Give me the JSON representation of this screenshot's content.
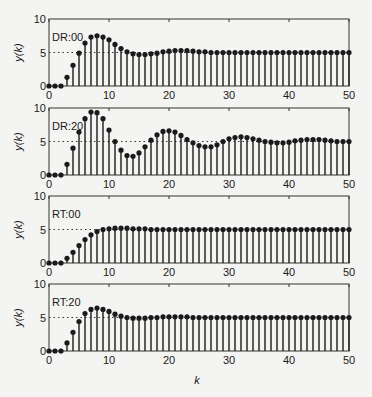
{
  "figure": {
    "xlabel": "k",
    "ylabel": "y(k)",
    "colors": {
      "stem": "#1a1a1a",
      "frame": "#333333",
      "reference": "#333333",
      "background": "#f4f4f2"
    }
  },
  "chart_data": [
    {
      "type": "stem",
      "label": "DR:00",
      "xlabel": "",
      "ylabel": "y(k)",
      "xlim": [
        0,
        50
      ],
      "ylim": [
        0,
        10
      ],
      "xticks": [
        0,
        10,
        20,
        30,
        40,
        50
      ],
      "yticks": [
        0,
        5,
        10
      ],
      "reference_line": 5,
      "x": [
        0,
        1,
        2,
        3,
        4,
        5,
        6,
        7,
        8,
        9,
        10,
        11,
        12,
        13,
        14,
        15,
        16,
        17,
        18,
        19,
        20,
        21,
        22,
        23,
        24,
        25,
        26,
        27,
        28,
        29,
        30,
        31,
        32,
        33,
        34,
        35,
        36,
        37,
        38,
        39,
        40,
        41,
        42,
        43,
        44,
        45,
        46,
        47,
        48,
        49,
        50
      ],
      "values": [
        0,
        0,
        0,
        1.3,
        3.1,
        4.9,
        6.4,
        7.3,
        7.5,
        7.3,
        6.9,
        6.2,
        5.6,
        5.1,
        4.8,
        4.7,
        4.7,
        4.8,
        4.9,
        5.1,
        5.2,
        5.3,
        5.3,
        5.3,
        5.2,
        5.1,
        5.1,
        5.0,
        5.0,
        5.0,
        5.0,
        5.0,
        5.0,
        5.0,
        5.0,
        5.0,
        5.0,
        5.0,
        5.0,
        5.0,
        5.0,
        5.0,
        5.0,
        5.0,
        5.0,
        5.0,
        5.0,
        5.0,
        5.0,
        5.0,
        5.0
      ]
    },
    {
      "type": "stem",
      "label": "DR:20",
      "xlabel": "",
      "ylabel": "y(k)",
      "xlim": [
        0,
        50
      ],
      "ylim": [
        0,
        10
      ],
      "xticks": [
        0,
        10,
        20,
        30,
        40,
        50
      ],
      "yticks": [
        0,
        5,
        10
      ],
      "reference_line": 5,
      "x": [
        0,
        1,
        2,
        3,
        4,
        5,
        6,
        7,
        8,
        9,
        10,
        11,
        12,
        13,
        14,
        15,
        16,
        17,
        18,
        19,
        20,
        21,
        22,
        23,
        24,
        25,
        26,
        27,
        28,
        29,
        30,
        31,
        32,
        33,
        34,
        35,
        36,
        37,
        38,
        39,
        40,
        41,
        42,
        43,
        44,
        45,
        46,
        47,
        48,
        49,
        50
      ],
      "values": [
        0,
        0,
        0,
        1.6,
        4.0,
        6.4,
        8.4,
        9.4,
        9.3,
        8.4,
        6.7,
        5.0,
        3.7,
        2.9,
        2.8,
        3.3,
        4.2,
        5.2,
        6.0,
        6.5,
        6.6,
        6.4,
        5.9,
        5.3,
        4.8,
        4.4,
        4.2,
        4.2,
        4.5,
        5.0,
        5.4,
        5.6,
        5.7,
        5.6,
        5.4,
        5.2,
        5.0,
        4.9,
        4.8,
        4.8,
        4.9,
        5.1,
        5.2,
        5.3,
        5.3,
        5.3,
        5.2,
        5.1,
        5.0,
        5.0,
        5.0
      ]
    },
    {
      "type": "stem",
      "label": "RT:00",
      "xlabel": "",
      "ylabel": "y(k)",
      "xlim": [
        0,
        50
      ],
      "ylim": [
        0,
        10
      ],
      "xticks": [
        0,
        10,
        20,
        30,
        40,
        50
      ],
      "yticks": [
        0,
        5,
        10
      ],
      "reference_line": 5,
      "x": [
        0,
        1,
        2,
        3,
        4,
        5,
        6,
        7,
        8,
        9,
        10,
        11,
        12,
        13,
        14,
        15,
        16,
        17,
        18,
        19,
        20,
        21,
        22,
        23,
        24,
        25,
        26,
        27,
        28,
        29,
        30,
        31,
        32,
        33,
        34,
        35,
        36,
        37,
        38,
        39,
        40,
        41,
        42,
        43,
        44,
        45,
        46,
        47,
        48,
        49,
        50
      ],
      "values": [
        0,
        0,
        0,
        0.7,
        1.6,
        2.6,
        3.5,
        4.2,
        4.7,
        5.0,
        5.1,
        5.2,
        5.2,
        5.2,
        5.1,
        5.1,
        5.1,
        5.0,
        5.0,
        5.0,
        5.0,
        5.0,
        5.0,
        5.0,
        5.0,
        5.0,
        5.0,
        5.0,
        5.0,
        5.0,
        5.0,
        5.0,
        5.0,
        5.0,
        5.0,
        5.0,
        5.0,
        5.0,
        5.0,
        5.0,
        5.0,
        5.0,
        5.0,
        5.0,
        5.0,
        5.0,
        5.0,
        5.0,
        5.0,
        5.0,
        5.0
      ]
    },
    {
      "type": "stem",
      "label": "RT:20",
      "xlabel": "k",
      "ylabel": "y(k)",
      "xlim": [
        0,
        50
      ],
      "ylim": [
        0,
        10
      ],
      "xticks": [
        0,
        10,
        20,
        30,
        40,
        50
      ],
      "yticks": [
        0,
        5,
        10
      ],
      "reference_line": 5,
      "x": [
        0,
        1,
        2,
        3,
        4,
        5,
        6,
        7,
        8,
        9,
        10,
        11,
        12,
        13,
        14,
        15,
        16,
        17,
        18,
        19,
        20,
        21,
        22,
        23,
        24,
        25,
        26,
        27,
        28,
        29,
        30,
        31,
        32,
        33,
        34,
        35,
        36,
        37,
        38,
        39,
        40,
        41,
        42,
        43,
        44,
        45,
        46,
        47,
        48,
        49,
        50
      ],
      "values": [
        0,
        0,
        0,
        1.2,
        2.8,
        4.4,
        5.6,
        6.2,
        6.4,
        6.2,
        5.9,
        5.5,
        5.2,
        5.0,
        4.9,
        4.9,
        4.9,
        5.0,
        5.0,
        5.1,
        5.1,
        5.1,
        5.1,
        5.1,
        5.0,
        5.0,
        5.0,
        5.0,
        5.0,
        5.0,
        5.0,
        5.0,
        5.0,
        5.0,
        5.0,
        5.0,
        5.0,
        5.0,
        5.0,
        5.0,
        5.0,
        5.0,
        5.0,
        5.0,
        5.0,
        5.0,
        5.0,
        5.0,
        5.0,
        5.0,
        5.0
      ]
    }
  ]
}
